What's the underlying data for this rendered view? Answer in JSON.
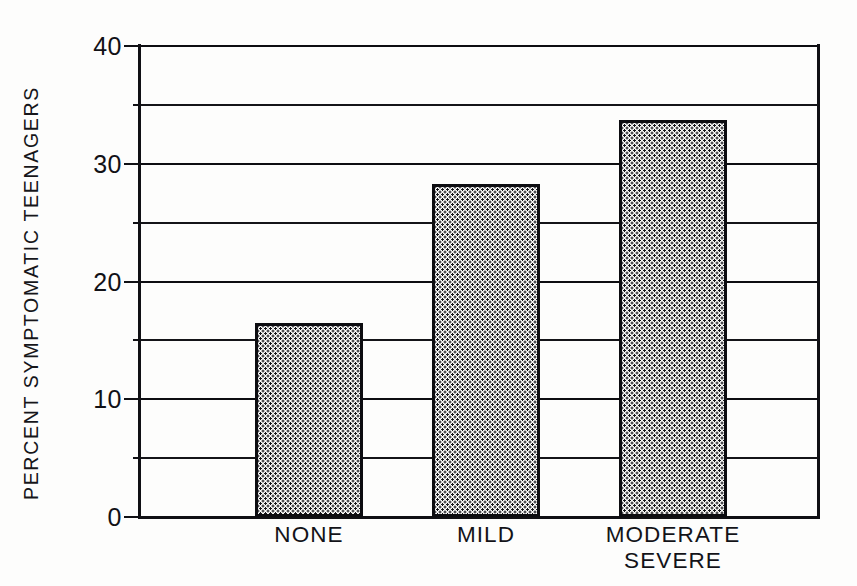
{
  "chart_data": {
    "type": "bar",
    "title": "",
    "subtitle": "",
    "xlabel": "",
    "ylabel": "PERCENT SYMPTOMATIC TEENAGERS",
    "categories": [
      "NONE",
      "MILD",
      "MODERATE\nSEVERE"
    ],
    "values": [
      16.5,
      28.3,
      33.7
    ],
    "ylim": [
      0,
      40
    ],
    "yticks": [
      0,
      10,
      20,
      30,
      40
    ],
    "ytick_labels": [
      "0",
      "10",
      "20",
      "30",
      "40"
    ],
    "minor_gridlines": [
      5,
      15,
      25,
      35
    ],
    "grid": true,
    "legend": null,
    "legend_position": "none",
    "bar_fill": "dotted-stipple",
    "colors": {
      "ink": "#101014",
      "paper": "#fdfdfc",
      "bar_fill": "#fbfbfa",
      "bar_dots": "#15151a"
    }
  },
  "axis": {
    "y_title": "PERCENT SYMPTOMATIC TEENAGERS"
  }
}
